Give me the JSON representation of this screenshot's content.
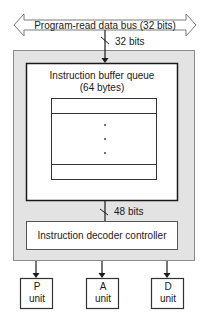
{
  "diagram": {
    "bus": {
      "label": "Program-read data bus (32 bits)",
      "width_label": "32 bits"
    },
    "queue": {
      "title_line1": "Instruction buffer queue",
      "title_line2": "(64 bytes)",
      "ellipsis": "⋮"
    },
    "queue_to_decoder_width": "48 bits",
    "decoder": {
      "label": "Instruction decoder controller"
    },
    "units": [
      {
        "line1": "P",
        "line2": "unit"
      },
      {
        "line1": "A",
        "line2": "unit"
      },
      {
        "line1": "D",
        "line2": "unit"
      }
    ],
    "colors": {
      "outer_fill": "#e3e3e3",
      "outer_stroke": "#8a8a8a",
      "line": "#1a1a1a",
      "box_fill": "#ffffff"
    }
  }
}
